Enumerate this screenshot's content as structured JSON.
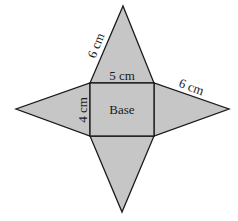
{
  "diagram": {
    "type": "net-of-rectangular-pyramid",
    "fill_color": "#c6c6c6",
    "stroke_color": "#1a1a1a",
    "base": {
      "label": "Base",
      "width_label": "5 cm",
      "height_label": "4 cm"
    },
    "edge_labels": {
      "top_slant": "6 cm",
      "right_slant": "6 cm"
    },
    "faces": [
      "top-triangle",
      "right-triangle",
      "bottom-triangle",
      "left-triangle",
      "base-rectangle"
    ]
  }
}
